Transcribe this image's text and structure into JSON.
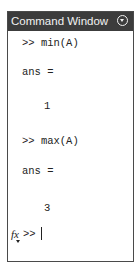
{
  "window": {
    "title": "Command Window",
    "menu_icon": "circle-chevron-down-icon"
  },
  "history": [
    {
      "type": "command",
      "text": ">> min(A)"
    },
    {
      "type": "output",
      "text": "ans ="
    },
    {
      "type": "value",
      "text": "1"
    },
    {
      "type": "command",
      "text": ">> max(A)"
    },
    {
      "type": "output",
      "text": "ans ="
    },
    {
      "type": "value",
      "text": "3"
    }
  ],
  "prompt": {
    "fx_label": "fx",
    "symbol": ">>",
    "input_value": ""
  }
}
